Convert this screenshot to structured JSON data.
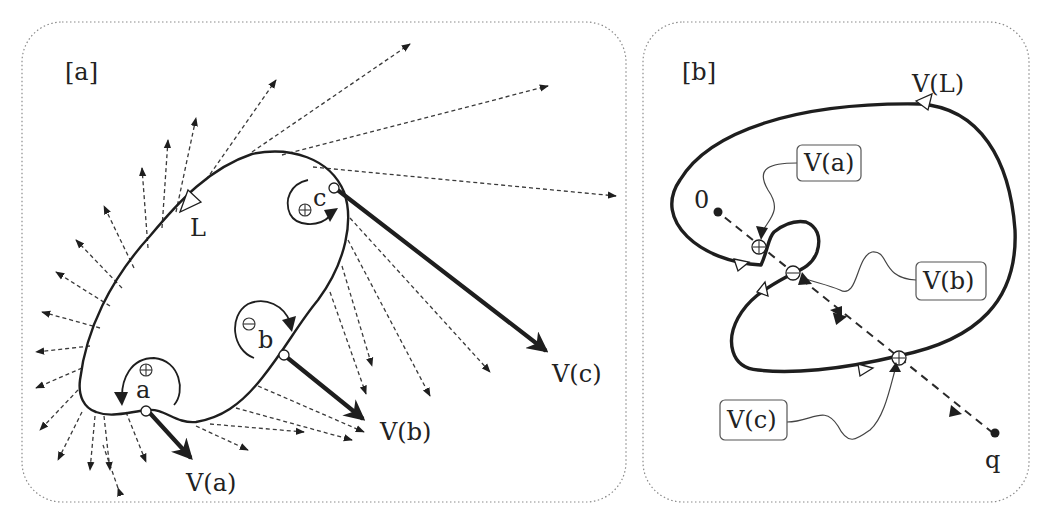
{
  "panels": [
    {
      "id": "a",
      "label": "[a]",
      "curve_label": "L",
      "points": [
        {
          "name": "a",
          "sign": "⊕",
          "vector_label": "V(a)"
        },
        {
          "name": "b",
          "sign": "⊖",
          "vector_label": "V(b)"
        },
        {
          "name": "c",
          "sign": "⊕",
          "vector_label": "V(c)"
        }
      ]
    },
    {
      "id": "b",
      "label": "[b]",
      "curve_label": "V(L)",
      "origin_label": "0",
      "query_label": "q",
      "callouts": [
        {
          "label": "V(a)",
          "sign": "⊕"
        },
        {
          "label": "V(b)",
          "sign": "⊖"
        },
        {
          "label": "V(c)",
          "sign": "⊕"
        }
      ]
    }
  ],
  "colors": {
    "ink": "#1e1e1e",
    "frame": "#8a8a8a",
    "background": "#ffffff"
  }
}
